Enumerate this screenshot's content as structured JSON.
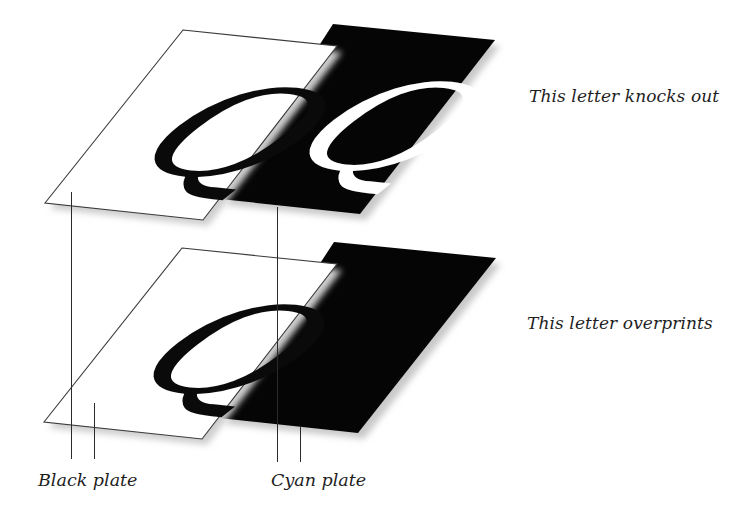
{
  "diagram": {
    "type": "printing-separation-illustration",
    "colors": {
      "background": "#ffffff",
      "plate_black_fill": "#050505",
      "plate_white_fill": "#ffffff",
      "outline": "#3a3a3a",
      "shadow": "#c8c8c8",
      "text": "#1e1e1e"
    },
    "letter": "Q",
    "rows": [
      {
        "id": "knockout",
        "caption": "This letter knocks out",
        "black_plate_letter_color": "#0a0a0a",
        "cyan_plate_letter_color": "#ffffff"
      },
      {
        "id": "overprint",
        "caption": "This letter overprints",
        "black_plate_letter_color": "#0a0a0a",
        "cyan_plate_letter_color": null
      }
    ],
    "labels": {
      "black_plate": "Black plate",
      "cyan_plate": "Cyan plate"
    }
  }
}
